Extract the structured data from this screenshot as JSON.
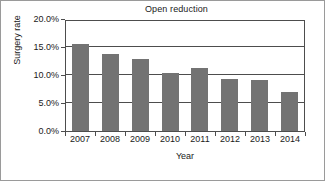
{
  "chart_data": {
    "type": "bar",
    "title": "Open reduction",
    "xlabel": "Year",
    "ylabel": "Surgery rate",
    "categories": [
      "2007",
      "2008",
      "2009",
      "2010",
      "2011",
      "2012",
      "2013",
      "2014"
    ],
    "values": [
      15.6,
      13.8,
      12.9,
      10.3,
      11.3,
      9.3,
      9.1,
      7.0
    ],
    "ylim": [
      0.0,
      20.0
    ],
    "ytick_values": [
      0.0,
      5.0,
      10.0,
      15.0,
      20.0
    ],
    "ytick_labels": [
      "0.0%",
      "5.0%",
      "10.0%",
      "15.0%",
      "20.0%"
    ],
    "grid": "horizontal",
    "legend": "none",
    "units": "percent",
    "bar_color": "#737373",
    "axis_color": "#4d4d4d"
  }
}
